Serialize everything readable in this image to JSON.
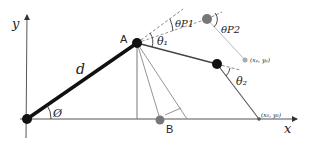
{
  "diagram": {
    "axes": {
      "x_label": "x",
      "y_label": "y"
    },
    "points": {
      "origin": {
        "x": 27,
        "y": 119
      },
      "A": {
        "label": "A",
        "x": 137,
        "y": 43
      },
      "joint2": {
        "x": 217,
        "y": 64
      },
      "end": {
        "label": "(x₀, y₀)",
        "x": 259,
        "y": 119
      },
      "target": {
        "label": "(xₚ, yₚ)",
        "x": 245,
        "y": 60
      },
      "P_joint": {
        "x": 207,
        "y": 19
      },
      "B": {
        "label": "B",
        "x": 160,
        "y": 120
      }
    },
    "labels": {
      "link_length": "d",
      "base_angle": "Ø",
      "theta1": "θ₁",
      "theta2": "θ₂",
      "thetaP1": "θP1",
      "thetaP2": "θP2"
    },
    "colors": {
      "link": "#111111",
      "joint": "#111111",
      "ghost_joint": "#777777",
      "target": "#aaaaaa",
      "thin_line": "#555555",
      "dashed": "#666666"
    }
  }
}
